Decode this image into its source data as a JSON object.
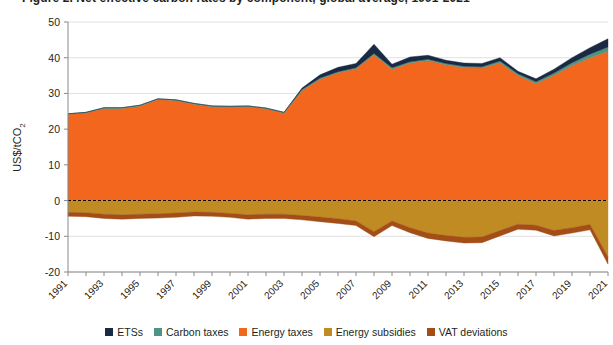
{
  "title": "Figure 2. Net effective carbon rates by component, global average, 1991-2021",
  "axes": {
    "ylabel_main": "US$/tCO",
    "ylabel_sub": "2",
    "yticks": [
      50,
      40,
      30,
      20,
      10,
      0,
      -10,
      -20
    ],
    "ylim": [
      -20,
      50
    ],
    "xticks": [
      "1991",
      "1993",
      "1995",
      "1997",
      "1999",
      "2001",
      "2003",
      "2005",
      "2007",
      "2009",
      "2011",
      "2013",
      "2015",
      "2017",
      "2019",
      "2021"
    ],
    "xlim": [
      1991,
      2021
    ],
    "zero_line": 0
  },
  "legend": {
    "position": "bottom",
    "items": [
      {
        "label": "ETSs",
        "color": "#1b2a43"
      },
      {
        "label": "Carbon taxes",
        "color": "#4e9383"
      },
      {
        "label": "Energy taxes",
        "color": "#f2661d"
      },
      {
        "label": "Energy subsidies",
        "color": "#c08b23"
      },
      {
        "label": "VAT deviations",
        "color": "#a34d17"
      }
    ]
  },
  "chart_data": {
    "type": "area",
    "title": "Net effective carbon rates by component, global average, 1991-2021",
    "xlabel": "",
    "ylabel": "US$/tCO2",
    "ylim": [
      -20,
      50
    ],
    "grid": true,
    "stacked": true,
    "x": [
      1991,
      1992,
      1993,
      1994,
      1995,
      1996,
      1997,
      1998,
      1999,
      2000,
      2001,
      2002,
      2003,
      2004,
      2005,
      2006,
      2007,
      2008,
      2009,
      2010,
      2011,
      2012,
      2013,
      2014,
      2015,
      2016,
      2017,
      2018,
      2019,
      2020,
      2021
    ],
    "series": [
      {
        "name": "Energy taxes",
        "color": "#f2661d",
        "values": [
          24.2,
          24.6,
          25.8,
          25.8,
          26.5,
          28.3,
          28.0,
          27.0,
          26.3,
          26.2,
          26.3,
          25.7,
          24.5,
          30.8,
          34.0,
          35.8,
          36.9,
          40.8,
          36.8,
          38.5,
          39.2,
          38.0,
          37.2,
          37.1,
          38.6,
          35.0,
          32.8,
          35.1,
          37.8,
          40.0,
          41.8
        ]
      },
      {
        "name": "Carbon taxes",
        "color": "#4e9383",
        "values": [
          0.1,
          0.1,
          0.2,
          0.2,
          0.2,
          0.2,
          0.2,
          0.2,
          0.2,
          0.2,
          0.2,
          0.2,
          0.2,
          0.3,
          0.3,
          0.3,
          0.3,
          0.4,
          0.4,
          0.4,
          0.4,
          0.4,
          0.4,
          0.4,
          0.5,
          0.5,
          0.5,
          0.6,
          0.8,
          1.0,
          1.2
        ]
      },
      {
        "name": "ETSs",
        "color": "#1b2a43",
        "values": [
          0.0,
          0.0,
          0.0,
          0.0,
          0.0,
          0.0,
          0.0,
          0.0,
          0.0,
          0.0,
          0.0,
          0.0,
          0.0,
          0.4,
          0.9,
          1.2,
          1.2,
          2.6,
          1.0,
          1.3,
          1.1,
          0.9,
          0.9,
          0.9,
          0.9,
          0.7,
          0.8,
          1.1,
          1.4,
          1.8,
          2.3
        ]
      },
      {
        "name": "Energy subsidies",
        "color": "#c08b23",
        "values": [
          -3.3,
          -3.4,
          -3.8,
          -4.0,
          -3.8,
          -3.7,
          -3.5,
          -3.2,
          -3.3,
          -3.6,
          -4.0,
          -3.8,
          -3.8,
          -4.2,
          -4.6,
          -5.1,
          -5.7,
          -8.7,
          -5.7,
          -7.6,
          -9.1,
          -9.8,
          -10.3,
          -10.2,
          -8.4,
          -6.6,
          -6.9,
          -8.4,
          -7.6,
          -6.7,
          -15.8
        ]
      },
      {
        "name": "VAT deviations",
        "color": "#a34d17",
        "values": [
          -1.1,
          -1.1,
          -1.2,
          -1.2,
          -1.2,
          -1.2,
          -1.2,
          -1.1,
          -1.1,
          -1.1,
          -1.2,
          -1.2,
          -1.2,
          -1.2,
          -1.3,
          -1.3,
          -1.3,
          -1.4,
          -1.3,
          -1.4,
          -1.5,
          -1.5,
          -1.6,
          -1.6,
          -1.5,
          -1.4,
          -1.4,
          -1.5,
          -1.5,
          -1.5,
          -2.0
        ]
      }
    ],
    "totals_positive": [
      24.3,
      24.7,
      26.0,
      26.0,
      26.7,
      28.5,
      28.2,
      27.2,
      26.5,
      26.4,
      26.5,
      25.9,
      24.7,
      31.5,
      35.2,
      37.3,
      38.4,
      43.8,
      38.2,
      40.2,
      40.7,
      39.3,
      38.5,
      38.4,
      40.0,
      36.2,
      34.1,
      36.8,
      40.0,
      42.8,
      45.3
    ],
    "totals_negative": [
      -4.4,
      -4.5,
      -5.0,
      -5.2,
      -5.0,
      -4.9,
      -4.7,
      -4.3,
      -4.4,
      -4.7,
      -5.2,
      -5.0,
      -5.0,
      -5.4,
      -5.9,
      -6.4,
      -7.0,
      -10.1,
      -7.0,
      -9.0,
      -10.6,
      -11.3,
      -11.9,
      -11.8,
      -9.9,
      -8.0,
      -8.3,
      -9.9,
      -9.1,
      -8.2,
      -17.8
    ]
  }
}
